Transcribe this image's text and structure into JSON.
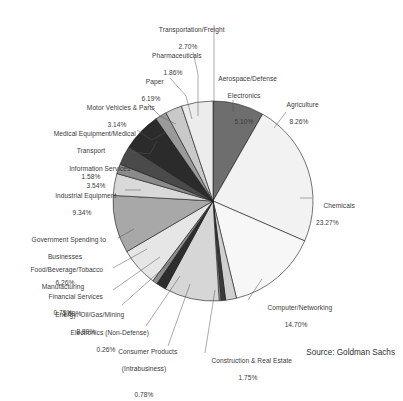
{
  "figure": {
    "source_note": "Source: Goldman Sachs"
  },
  "chart_data": {
    "type": "pie",
    "title": "",
    "subtitle": "",
    "xlabel": "",
    "ylabel": "",
    "legend_position": "none",
    "grid": false,
    "units": "percent",
    "value_format": "0.00%",
    "total": 100.0,
    "start_angle_deg": 0,
    "direction": "clockwise",
    "labels_placement": "external-with-leader-lines",
    "categories": [
      "Agriculture",
      "Chemicals",
      "Computer/Networking",
      "Construction & Real Estate",
      "Consumer Products (Intrabusiness)",
      "Electronics (Non-Defense)",
      "Energy: Oil/Gas/Mining",
      "Financial Services",
      "Food/Beverage/Tobacco Manufacturing",
      "Government Spending to Businesses",
      "Industrial Equipment",
      "Information Services",
      "Medical Equipment/Medical Transport",
      "Motor Vehicles & Parts",
      "Paper",
      "Pharmaceuticals",
      "Transportation/Freight",
      "Aerospace/Defense Electronics"
    ],
    "values": [
      8.26,
      23.27,
      14.7,
      1.75,
      0.78,
      0.26,
      8.89,
      1.59,
      0.79,
      6.26,
      9.34,
      3.54,
      1.58,
      3.14,
      6.19,
      1.86,
      2.7,
      5.1
    ],
    "slices": [
      {
        "name": "Agriculture",
        "value": 8.26,
        "color": "#6e6e6e"
      },
      {
        "name": "Chemicals",
        "value": 23.27,
        "color": "#f2f2f2"
      },
      {
        "name": "Computer/Networking",
        "value": 14.7,
        "color": "#f7f7f7"
      },
      {
        "name": "Construction & Real Estate",
        "value": 1.75,
        "color": "#d0d0d0"
      },
      {
        "name": "Consumer Products (Intrabusiness)",
        "value": 0.78,
        "color": "#3a3a3a"
      },
      {
        "name": "Electronics (Non-Defense)",
        "value": 0.26,
        "color": "#b8b8b8"
      },
      {
        "name": "Energy: Oil/Gas/Mining",
        "value": 8.89,
        "color": "#d6d6d6"
      },
      {
        "name": "Financial Services",
        "value": 1.59,
        "color": "#2e2e2e"
      },
      {
        "name": "Food/Beverage/Tobacco Manufacturing",
        "value": 0.79,
        "color": "#8f8f8f"
      },
      {
        "name": "Government Spending to Businesses",
        "value": 6.26,
        "color": "#e6e6e6"
      },
      {
        "name": "Industrial Equipment",
        "value": 9.34,
        "color": "#a8a8a8"
      },
      {
        "name": "Information Services",
        "value": 3.54,
        "color": "#d9d9d9"
      },
      {
        "name": "Medical Equipment/Medical Transport",
        "value": 1.58,
        "color": "#8a8a8a"
      },
      {
        "name": "Motor Vehicles & Parts",
        "value": 3.14,
        "color": "#4a4a4a"
      },
      {
        "name": "Paper",
        "value": 6.19,
        "color": "#2b2b2b"
      },
      {
        "name": "Pharmaceuticals",
        "value": 1.86,
        "color": "#9a9a9a"
      },
      {
        "name": "Transportation/Freight",
        "value": 2.7,
        "color": "#c9c9c9"
      },
      {
        "name": "Aerospace/Defense Electronics",
        "value": 5.1,
        "color": "#ececec"
      }
    ]
  },
  "labels": {
    "transportation_freight": {
      "name": "Transportation/Freight",
      "pct": "2.70%"
    },
    "pharmaceuticals": {
      "name": "Pharmaceuticals",
      "pct": "1.86%"
    },
    "paper": {
      "name": "Paper",
      "pct": "6.19%"
    },
    "motor_vehicles": {
      "name": "Motor Vehicles & Parts",
      "pct": "3.14%"
    },
    "medical_equipment": {
      "name": "Medical Equipment/Medical",
      "name2": "Transport",
      "pct": "1.58%"
    },
    "information_services": {
      "name": "Information Services",
      "pct": "3.54%"
    },
    "industrial_equipment": {
      "name": "Industrial Equipment",
      "pct": "9.34%"
    },
    "government_spending": {
      "name": "Government Spending to",
      "name2": "Businesses",
      "pct": "6.26%"
    },
    "food_beverage_tobacco": {
      "name": "Food/Beverage/Tobacco",
      "name2": "Manufacturing",
      "pct": "0.79%"
    },
    "financial_services": {
      "name": "Financial Services",
      "pct": "1.59%"
    },
    "energy_oil_gas_mining": {
      "name": "Energy: Oil/Gas/Mining",
      "pct": "8.89%"
    },
    "electronics_non_defense": {
      "name": "Electronics (Non-Defense)",
      "pct": "0.26%"
    },
    "consumer_products": {
      "name": "Consumer Products",
      "name2": "(Intrabusiness)",
      "pct": "0.78%"
    },
    "construction_real_estate": {
      "name": "Construction & Real Estate",
      "pct": "1.75%"
    },
    "computer_networking": {
      "name": "Computer/Networking",
      "pct": "14.70%"
    },
    "chemicals": {
      "name": "Chemicals",
      "pct": "23.27%"
    },
    "agriculture": {
      "name": "Agriculture",
      "pct": "8.26%"
    },
    "aerospace_defense": {
      "name": "Aerospace/Defense",
      "name2": "Electronics",
      "pct": "5.10%"
    }
  }
}
